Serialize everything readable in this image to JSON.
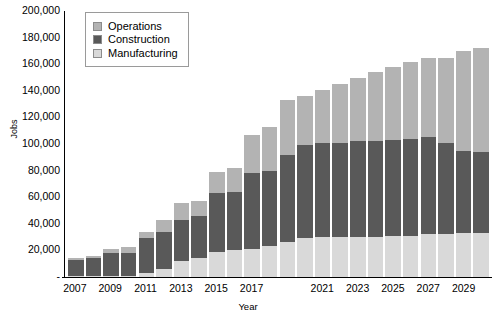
{
  "chart_data": {
    "type": "bar",
    "stacked": true,
    "title": "",
    "xlabel": "Year",
    "ylabel": "Jobs",
    "ylim": [
      0,
      200000
    ],
    "ytick_labels": [
      "200,000",
      "180,000",
      "160,000",
      "140,000",
      "120,000",
      "100,000",
      "80,000",
      "60,000",
      "40,000",
      "20,000",
      "-"
    ],
    "ytick_values": [
      200000,
      180000,
      160000,
      140000,
      120000,
      100000,
      80000,
      60000,
      40000,
      20000,
      0
    ],
    "grid": false,
    "legend_position": "top-left",
    "categories": [
      "2007",
      "2008",
      "2009",
      "2010",
      "2011",
      "2012",
      "2013",
      "2014",
      "2015",
      "2016",
      "2017",
      "2018",
      "2019",
      "2020",
      "2021",
      "2022",
      "2023",
      "2024",
      "2025",
      "2026",
      "2027",
      "2028",
      "2029",
      "2030"
    ],
    "xtick_labels_shown": [
      "2007",
      "2009",
      "2011",
      "2013",
      "2015",
      "2017",
      "2021",
      "2023",
      "2025",
      "2027",
      "2029"
    ],
    "series": [
      {
        "name": "Manufacturing",
        "color": "#d9d9d9",
        "values": [
          500,
          500,
          800,
          800,
          3000,
          6000,
          12000,
          14000,
          19000,
          20000,
          21000,
          23000,
          26000,
          29000,
          30000,
          30000,
          30000,
          30000,
          31000,
          31000,
          32000,
          32000,
          33000,
          33000
        ]
      },
      {
        "name": "Construction",
        "color": "#595959",
        "values": [
          12500,
          13500,
          17500,
          17500,
          26000,
          28000,
          31000,
          32000,
          44000,
          44000,
          57000,
          57000,
          66000,
          70000,
          71000,
          71000,
          72000,
          72000,
          72000,
          73000,
          73000,
          69000,
          62000,
          61000
        ]
      },
      {
        "name": "Operations",
        "color": "#b3b3b3",
        "values": [
          1000,
          1500,
          3000,
          4000,
          5000,
          9000,
          13000,
          11000,
          16000,
          18000,
          29000,
          33000,
          41000,
          37000,
          40000,
          44000,
          48000,
          52000,
          55000,
          58000,
          60000,
          64000,
          75000,
          78000
        ]
      }
    ],
    "totals": [
      14000,
      15500,
      21300,
      22300,
      34000,
      43000,
      56000,
      57000,
      79000,
      82000,
      107000,
      113000,
      133000,
      136000,
      141000,
      145000,
      150000,
      154000,
      158000,
      162000,
      165000,
      165000,
      170000,
      172000
    ]
  },
  "legend": {
    "items": [
      {
        "label": "Operations",
        "color": "#b3b3b3"
      },
      {
        "label": "Construction",
        "color": "#595959"
      },
      {
        "label": "Manufacturing",
        "color": "#d9d9d9"
      }
    ]
  }
}
